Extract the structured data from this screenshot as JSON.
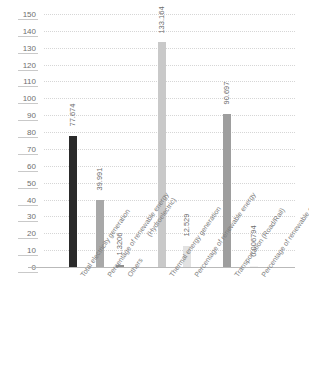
{
  "chart_data": {
    "type": "bar",
    "title": "",
    "subtitle": "",
    "xlabel": "",
    "ylabel": "",
    "ylim": [
      0,
      150
    ],
    "ytick_step": 10,
    "grid": true,
    "legend": "none",
    "orientation": "vertical",
    "categories": [
      "Total electricity generation",
      "Percentage of renewable energy (Hydroelectric)",
      "Others",
      "Thermal energy generation",
      "Percentage of renewable energy",
      "Transportation (Road/Rail)",
      "Percentage of renewable energy"
    ],
    "category_lines": [
      [
        "Total electricity generation"
      ],
      [
        "Percentage of renewable energy",
        "(Hydroelectric)"
      ],
      [
        "Others"
      ],
      [
        "Thermal energy generation"
      ],
      [
        "Percentage of renewable energy"
      ],
      [
        "Transportation (Road/Rail)"
      ],
      [
        "Percentage of renewable energy"
      ]
    ],
    "values": [
      77.674,
      39.991,
      1.3206,
      133.164,
      12.529,
      90.697,
      0.006794
    ],
    "value_labels": [
      "77.674",
      "39.991",
      "1.3206",
      "133.164",
      "12.529",
      "90.697",
      "0.006794"
    ],
    "bar_colors": [
      "#2a2a2a",
      "#a8a8a8",
      "#8f8f8f",
      "#c9c9c9",
      "#e2e2e2",
      "#9e9e9e",
      "#f2f2f2"
    ],
    "ytick_labels": [
      "150",
      "140",
      "130",
      "120",
      "110",
      "100",
      "90",
      "80",
      "70",
      "60",
      "50",
      "40",
      "30",
      "20",
      "10",
      "0"
    ],
    "ytick_values": [
      150,
      140,
      130,
      120,
      110,
      100,
      90,
      80,
      70,
      60,
      50,
      40,
      30,
      20,
      10,
      0
    ],
    "colors": {
      "background": "#ffffff",
      "gridline": "#d6d6d6",
      "axis": "#b9b9b9",
      "text": "#7a7a7a"
    }
  }
}
